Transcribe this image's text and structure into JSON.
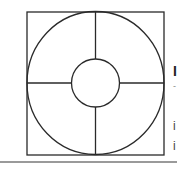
{
  "diagram": {
    "stroke_color": "#2a2a2a",
    "background": "#ffffff",
    "square": {
      "x": 27,
      "y": 12,
      "width": 137,
      "height": 143
    },
    "outer_circle": {
      "cx": 95.5,
      "cy": 83,
      "rx": 68.5,
      "ry": 71.5
    },
    "inner_circle": {
      "cx": 95.5,
      "cy": 83,
      "r": 24
    },
    "cross_lines": 4
  },
  "clipped_text": {
    "heading": "I",
    "line1": "-",
    "line2": "i",
    "line3": "i"
  },
  "divider_color": "#9a9a9a"
}
